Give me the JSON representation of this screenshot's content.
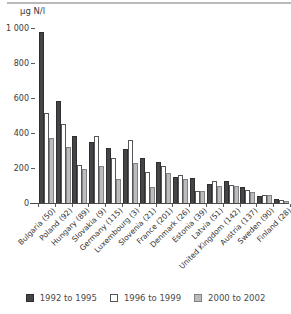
{
  "chart_data": {
    "type": "bar",
    "title": "",
    "ylabel": "µg N/l",
    "xlabel": "",
    "categories": [
      "Bulgaria (50)",
      "Poland (92)",
      "Hungary (89)",
      "Slovakia (9)",
      "Germany (115)",
      "Luxembourg (3)",
      "Slovenia (21)",
      "France (201)",
      "Denmark (26)",
      "Estonia (39)",
      "Latvia (51)",
      "United Kingdom (142)",
      "Austria (137)",
      "Sweden (90)",
      "Finland (28)"
    ],
    "series": [
      {
        "name": "1992 to 1995",
        "color": "#454547",
        "border_color": "#2e2e30",
        "values": [
          975,
          585,
          385,
          350,
          315,
          310,
          260,
          235,
          150,
          145,
          110,
          125,
          90,
          40,
          22
        ]
      },
      {
        "name": "1996 to 1999",
        "color": "#ffffff",
        "border_color": "#56565a",
        "values": [
          515,
          450,
          220,
          385,
          255,
          360,
          175,
          210,
          160,
          70,
          125,
          105,
          72,
          48,
          15
        ]
      },
      {
        "name": "2000 to 2002",
        "color": "#bcbcbc",
        "border_color": "#828284",
        "values": [
          370,
          320,
          195,
          210,
          135,
          230,
          90,
          170,
          135,
          70,
          100,
          95,
          63,
          43,
          12
        ]
      }
    ],
    "ylim": [
      0,
      1000
    ],
    "ytick_values": [
      0,
      200,
      400,
      600,
      800,
      1000
    ],
    "ytick_labels": [
      "0",
      "200",
      "400",
      "600",
      "800",
      "1 000"
    ],
    "grid": false,
    "legend_position": "bottom"
  }
}
